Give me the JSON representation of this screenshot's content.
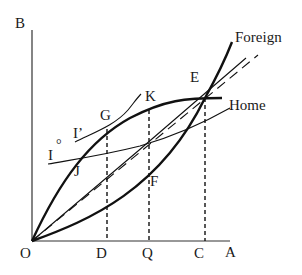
{
  "diagram": {
    "axes": {
      "x_label": "A",
      "y_label": "B",
      "origin_label": "O"
    },
    "x_ticks": [
      "D",
      "Q",
      "C"
    ],
    "curves": {
      "foreign": "Foreign",
      "home": "Home"
    },
    "points": {
      "E": "E",
      "G": "G",
      "K": "K",
      "F": "F",
      "J": "J"
    },
    "indifference_curves": {
      "I": "I",
      "I_prime": "I’",
      "I_degree": "°"
    },
    "colors": {
      "ink": "#111111",
      "background": "#ffffff"
    }
  }
}
